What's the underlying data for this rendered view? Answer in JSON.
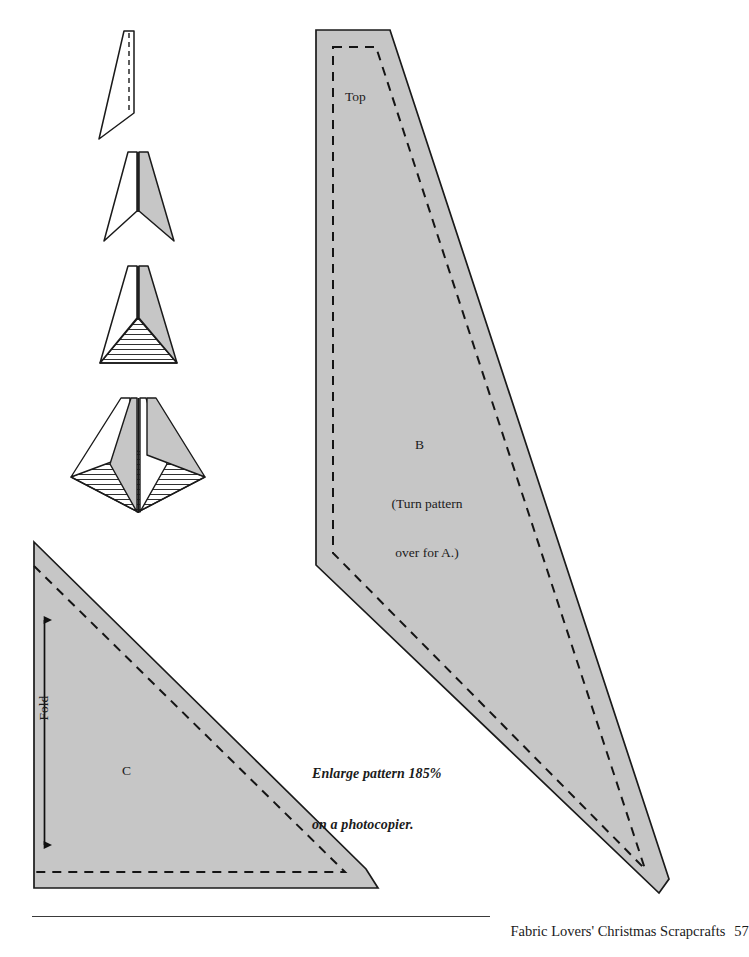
{
  "page": {
    "width": 711,
    "height": 957,
    "background": "#ffffff",
    "fill_gray": "#c6c6c6",
    "line_color": "#1a1a1a",
    "document_type": "craft-pattern-template-page"
  },
  "footer": {
    "book_title": "Fabric Lovers' Christmas Scrapcrafts",
    "page_number": "57",
    "rule_visible": true
  },
  "instructions": {
    "enlarge_line_1": "Enlarge pattern 185%",
    "enlarge_line_2": "on a photocopier."
  },
  "patterns": [
    {
      "id": "B",
      "label": "B",
      "top_label": "Top",
      "note_line_1": "(Turn pattern",
      "note_line_2": "over for A.)",
      "cut_line": "solid",
      "stitch_line": "dashed",
      "fill": "#c6c6c6"
    },
    {
      "id": "C",
      "label": "C",
      "fold_label": "Fold",
      "cut_line": "solid",
      "stitch_line": "dashed",
      "fill": "#c6c6c6",
      "arrow": "double-headed-vertical"
    }
  ],
  "assembly_diagrams": [
    {
      "step": 1,
      "name": "single-panel-with-fold-line",
      "shaded_panels": 0,
      "has_dashed_fold": true,
      "has_hatched_base": false
    },
    {
      "step": 2,
      "name": "two-panels-joined",
      "shaded_panels": 1,
      "has_dashed_fold": false,
      "has_hatched_base": false
    },
    {
      "step": 3,
      "name": "panels-with-hatched-base",
      "shaded_panels": 1,
      "has_dashed_fold": false,
      "has_hatched_base": true
    },
    {
      "step": 4,
      "name": "finished-four-panel-tree",
      "shaded_panels": 2,
      "has_dashed_fold": false,
      "has_hatched_base": true
    }
  ]
}
